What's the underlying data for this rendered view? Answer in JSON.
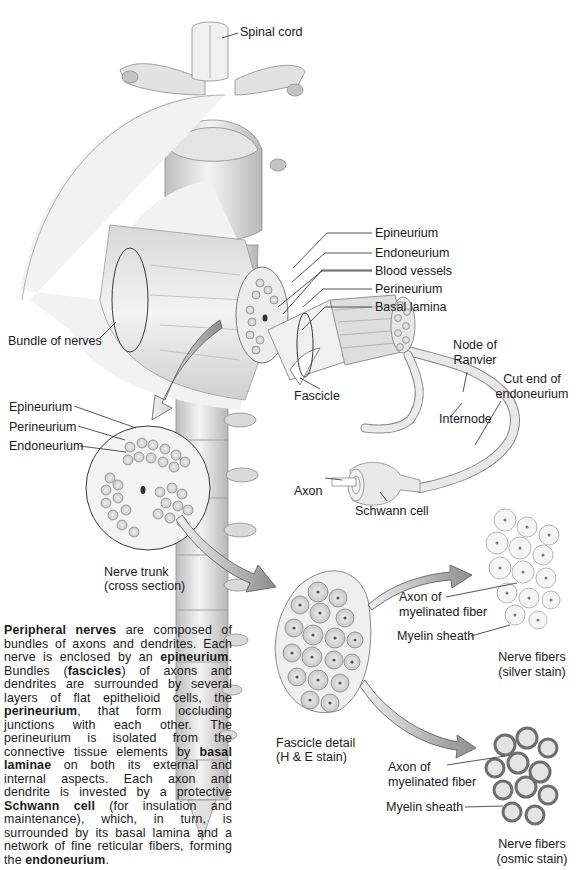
{
  "figure": {
    "labels": {
      "spinal_cord": "Spinal cord",
      "epineurium": "Epineurium",
      "endoneurium": "Endoneurium",
      "blood_vessels": "Blood vessels",
      "perineurium": "Perineurium",
      "basal_lamina": "Basal lamina",
      "bundle_of_nerves": "Bundle of nerves",
      "node_of_ranvier_1": "Node of",
      "node_of_ranvier_2": "Ranvier",
      "cut_end_1": "Cut end of",
      "cut_end_2": "endoneurium",
      "fascicle": "Fascicle",
      "internode": "Internode",
      "axon": "Axon",
      "schwann_cell": "Schwann cell"
    },
    "cross_section": {
      "epineurium": "Epineurium",
      "perineurium": "Perineurium",
      "endoneurium": "Endoneurium",
      "caption_1": "Nerve trunk",
      "caption_2": "(cross section)"
    },
    "fascicle_detail": {
      "caption_1": "Fascicle detail",
      "caption_2": "(H & E stain)"
    },
    "silver_stain": {
      "axon_1": "Axon of",
      "axon_2": "myelinated fiber",
      "myelin": "Myelin sheath",
      "caption_1": "Nerve fibers",
      "caption_2": "(silver stain)"
    },
    "osmic_stain": {
      "axon_1": "Axon of",
      "axon_2": "myelinated fiber",
      "myelin": "Myelin sheath",
      "caption_1": "Nerve fibers",
      "caption_2": "(osmic stain)"
    }
  },
  "description": {
    "segments": [
      {
        "text": "Peripheral nerves",
        "bold": true
      },
      {
        "text": " are composed of bundles of axons and dendrites. Each nerve is enclosed by an ",
        "bold": false
      },
      {
        "text": "epineurium",
        "bold": true
      },
      {
        "text": ". Bundles (",
        "bold": false
      },
      {
        "text": "fascicles",
        "bold": true
      },
      {
        "text": ") of axons and dendrites are surrounded by several layers of flat epithelioid cells, the ",
        "bold": false
      },
      {
        "text": "perineurium",
        "bold": true
      },
      {
        "text": ", that form occluding junctions with each other. The perineurium is isolated from the connective tissue elements by ",
        "bold": false
      },
      {
        "text": "basal laminae",
        "bold": true
      },
      {
        "text": " on both its external and internal aspects. Each axon and dendrite is invested by a protective ",
        "bold": false
      },
      {
        "text": "Schwann cell",
        "bold": true
      },
      {
        "text": " (for insulation and maintenance), which, in turn, is surrounded by its basal lamina and a network of fine reticular fibers, forming the ",
        "bold": false
      },
      {
        "text": "endoneurium",
        "bold": true
      },
      {
        "text": ".",
        "bold": false
      }
    ]
  },
  "colors": {
    "line": "#2a2a2a",
    "tissue_light": "#e9e9e9",
    "tissue_mid": "#c9c9c9",
    "tissue_dark": "#8a8a8a",
    "arrow": "#a8a8a8"
  }
}
